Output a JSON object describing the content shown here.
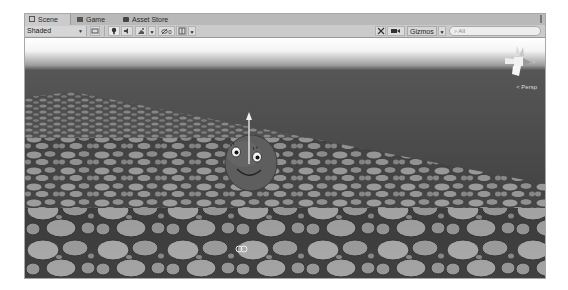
{
  "tabs": [
    {
      "label": "Scene",
      "icon": "hash-icon",
      "active": true
    },
    {
      "label": "Game",
      "icon": "game-icon",
      "active": false
    },
    {
      "label": "Asset Store",
      "icon": "bag-icon",
      "active": false
    }
  ],
  "toolbar": {
    "shading_mode": "Shaded",
    "mode_2d_icon": "2d-toggle-icon",
    "lighting_icon": "light-bulb-icon",
    "audio_icon": "speaker-icon",
    "effects_icon": "effects-icon",
    "hidden_objects_count": "0",
    "grid_icon": "grid-icon",
    "tools_icon": "tools-icon",
    "camera_icon": "camera-icon",
    "gizmos_label": "Gizmos",
    "search_placeholder": "All",
    "search_icon": "search-icon"
  },
  "viewport": {
    "projection_label": "< Persp",
    "selected_object": "smiley-sphere",
    "colors": {
      "sky_top": "#ffffff",
      "horizon": "#4c4c4c",
      "floor": "#8a8a8a",
      "stone": "#9e9e9e",
      "object": "#606060"
    }
  }
}
